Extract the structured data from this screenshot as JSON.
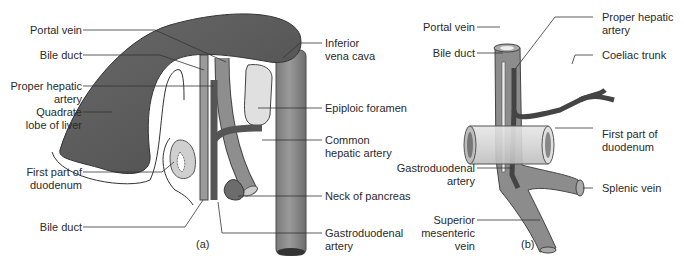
{
  "figure": {
    "panel_a": {
      "caption": "(a)",
      "labels": {
        "portal_vein": "Portal vein",
        "bile_duct_top": "Bile duct",
        "proper_hepatic_artery_1": "Proper hepatic",
        "proper_hepatic_artery_2": "artery",
        "quadrate_1": "Quadrate",
        "quadrate_2": "lobe of liver",
        "first_part_duodenum_1": "First part of",
        "first_part_duodenum_2": "duodenum",
        "bile_duct_bottom": "Bile duct",
        "inferior_vena_cava_1": "Inferior",
        "inferior_vena_cava_2": "vena cava",
        "epiploic_foramen": "Epiploic foramen",
        "common_hepatic_artery_1": "Common",
        "common_hepatic_artery_2": "hepatic artery",
        "neck_of_pancreas": "Neck of pancreas",
        "gastroduodenal_artery_1": "Gastroduodenal",
        "gastroduodenal_artery_2": "artery"
      }
    },
    "panel_b": {
      "caption": "(b)",
      "labels": {
        "portal_vein": "Portal vein",
        "bile_duct": "Bile duct",
        "gastroduodenal_artery_1": "Gastroduodenal",
        "gastroduodenal_artery_2": "artery",
        "superior_mesenteric_vein_1": "Superior",
        "superior_mesenteric_vein_2": "mesenteric",
        "superior_mesenteric_vein_3": "vein",
        "proper_hepatic_artery_1": "Proper hepatic",
        "proper_hepatic_artery_2": "artery",
        "coeliac_trunk": "Coeliac trunk",
        "first_part_duodenum_1": "First part of",
        "first_part_duodenum_2": "duodenum",
        "splenic_vein": "Splenic vein"
      }
    },
    "colors": {
      "liver": "#5e5e5e",
      "vein": "#8a8a8a",
      "artery": "#555555",
      "duodenum": "#d6d6d6",
      "leader": "#333333",
      "text": "#2a2a2a"
    }
  }
}
